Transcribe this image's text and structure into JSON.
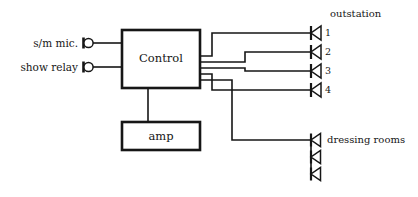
{
  "diagram": {
    "stroke_color": "#161616",
    "background": "#ffffff",
    "inputs": [
      {
        "label": "s/m mic.",
        "symbol": "jack-connector-icon",
        "x": 88,
        "y": 43
      },
      {
        "label": "show relay",
        "symbol": "jack-connector-icon",
        "x": 88,
        "y": 67
      }
    ],
    "blocks": [
      {
        "id": "control",
        "label": "Control",
        "x": 122,
        "y": 30,
        "w": 78,
        "h": 58
      },
      {
        "id": "amp",
        "label": "amp",
        "x": 122,
        "y": 122,
        "w": 78,
        "h": 28
      }
    ],
    "outstation": {
      "heading": "outstation",
      "speakers": [
        {
          "label": "1",
          "y": 33
        },
        {
          "label": "2",
          "y": 52
        },
        {
          "label": "3",
          "y": 71
        },
        {
          "label": "4",
          "y": 90
        }
      ]
    },
    "dressing_rooms": {
      "heading": "dressing rooms",
      "speakers": [
        {
          "y": 140
        },
        {
          "y": 157
        },
        {
          "y": 174
        }
      ]
    },
    "bus_lines": [
      {
        "y": 56
      },
      {
        "y": 62
      },
      {
        "y": 68
      },
      {
        "y": 74
      }
    ]
  }
}
